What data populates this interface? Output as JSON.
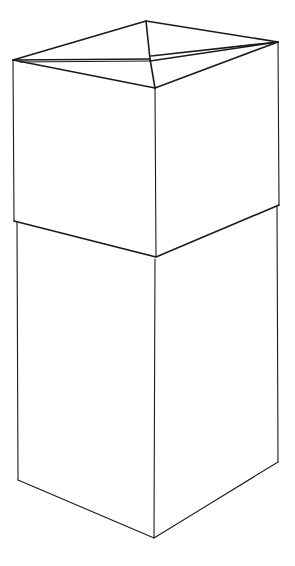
{
  "figure": {
    "stroke_color": "#1a1a1a",
    "background": "#ffffff"
  },
  "geometry": {
    "top_box": {
      "lid_back": [
        146,
        21
      ],
      "lid_left": [
        13,
        60
      ],
      "lid_right": [
        278,
        42
      ],
      "lid_front": [
        155,
        88
      ],
      "lid_center": [
        150,
        59
      ],
      "seam_left": [
        14,
        221
      ],
      "seam_front": [
        156,
        257
      ],
      "seam_right": [
        279,
        205
      ]
    },
    "bottom_box": {
      "top_left": [
        17,
        222
      ],
      "top_front": [
        155,
        259
      ],
      "top_right": [
        277,
        206
      ],
      "bottom_left": [
        18,
        480
      ],
      "bottom_front": [
        154,
        538
      ],
      "bottom_right": [
        278,
        462
      ]
    }
  }
}
